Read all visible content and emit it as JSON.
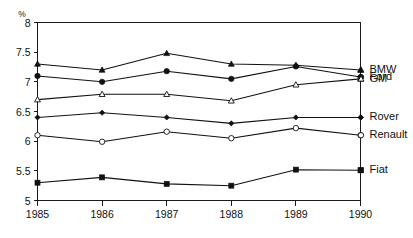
{
  "chart_data": {
    "type": "line",
    "title": "",
    "subtitle": "",
    "xlabel": "",
    "ylabel": "",
    "unit_label": "%",
    "categories": [
      "1985",
      "1986",
      "1987",
      "1988",
      "1989",
      "1990"
    ],
    "x": [
      1985,
      1986,
      1987,
      1988,
      1989,
      1990
    ],
    "xlim": [
      1985,
      1990
    ],
    "ylim": [
      5,
      8
    ],
    "yticks": [
      5,
      5.5,
      6,
      6.5,
      7,
      7.5,
      8
    ],
    "ytick_labels": [
      "5",
      "5.5",
      "6",
      "6.5",
      "7",
      "7.5",
      "8"
    ],
    "grid": false,
    "legend_position": "right",
    "series": [
      {
        "name": "BMW",
        "marker": "filled-triangle",
        "values": [
          7.3,
          7.2,
          7.48,
          7.3,
          7.28,
          7.2
        ]
      },
      {
        "name": "Ford",
        "marker": "filled-circle",
        "values": [
          7.1,
          7.0,
          7.18,
          7.05,
          7.26,
          7.08
        ]
      },
      {
        "name": "GM",
        "marker": "open-triangle",
        "values": [
          6.7,
          6.79,
          6.79,
          6.68,
          6.95,
          7.05
        ]
      },
      {
        "name": "Rover",
        "marker": "filled-diamond",
        "values": [
          6.4,
          6.48,
          6.4,
          6.3,
          6.4,
          6.4
        ]
      },
      {
        "name": "Renault",
        "marker": "open-circle",
        "values": [
          6.1,
          5.99,
          6.16,
          6.05,
          6.22,
          6.1
        ]
      },
      {
        "name": "Fiat",
        "marker": "filled-square",
        "values": [
          5.3,
          5.39,
          5.28,
          5.25,
          5.52,
          5.51
        ]
      }
    ],
    "legend_entries": [
      {
        "label": "BMW",
        "marker": "filled-triangle",
        "y_value": 7.2
      },
      {
        "label": "Ford",
        "marker": "filled-circle",
        "y_value": 7.08
      },
      {
        "label": "GM",
        "marker": "open-triangle",
        "y_value": 7.05
      },
      {
        "label": "Rover",
        "marker": "filled-diamond",
        "y_value": 6.4
      },
      {
        "label": "Renault",
        "marker": "open-circle",
        "y_value": 6.1
      },
      {
        "label": "Fiat",
        "marker": "filled-square",
        "y_value": 5.51
      }
    ],
    "colors": {
      "line": "#111111",
      "axis": "#1a1a1a",
      "background": "#ffffff"
    }
  }
}
